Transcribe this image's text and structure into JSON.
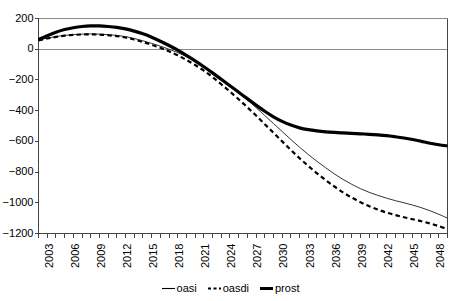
{
  "chart_data": {
    "type": "line",
    "title": "",
    "xlabel": "",
    "ylabel": "",
    "xlim": [
      2003,
      2050
    ],
    "ylim": [
      -1200,
      200
    ],
    "grid": false,
    "legend_position": "bottom-center",
    "y_ticks": [
      200,
      0,
      -200,
      -400,
      -600,
      -800,
      -1000,
      -1200
    ],
    "y_tick_labels": [
      "200",
      "0",
      "−200",
      "−400",
      "−600",
      "−800",
      "−1000",
      "−1200"
    ],
    "x_ticks": [
      2003,
      2006,
      2009,
      2012,
      2015,
      2018,
      2021,
      2024,
      2027,
      2030,
      2033,
      2036,
      2039,
      2042,
      2045,
      2048
    ],
    "x_tick_labels": [
      "2003",
      "2006",
      "2009",
      "2012",
      "2015",
      "2018",
      "2021",
      "2024",
      "2027",
      "2030",
      "2033",
      "2036",
      "2039",
      "2042",
      "2045",
      "2048"
    ],
    "x_minor_tick_step": 1,
    "x": [
      2003,
      2004,
      2005,
      2006,
      2007,
      2008,
      2009,
      2010,
      2011,
      2012,
      2013,
      2014,
      2015,
      2016,
      2017,
      2018,
      2019,
      2020,
      2021,
      2022,
      2023,
      2024,
      2025,
      2026,
      2027,
      2028,
      2029,
      2030,
      2031,
      2032,
      2033,
      2034,
      2035,
      2036,
      2037,
      2038,
      2039,
      2040,
      2041,
      2042,
      2043,
      2044,
      2045,
      2046,
      2047,
      2048,
      2049,
      2050
    ],
    "series": [
      {
        "name": "oasi",
        "style": "solid-thin",
        "color": "#333333",
        "values": [
          60,
          72,
          82,
          90,
          95,
          98,
          100,
          98,
          95,
          90,
          82,
          70,
          55,
          38,
          20,
          0,
          -22,
          -48,
          -78,
          -112,
          -150,
          -192,
          -236,
          -282,
          -330,
          -380,
          -432,
          -484,
          -536,
          -588,
          -638,
          -686,
          -730,
          -772,
          -812,
          -848,
          -880,
          -908,
          -932,
          -952,
          -970,
          -986,
          -1000,
          -1015,
          -1032,
          -1052,
          -1075,
          -1100
        ]
      },
      {
        "name": "oasdi",
        "style": "dashed",
        "color": "#000000",
        "values": [
          58,
          70,
          80,
          88,
          93,
          96,
          97,
          95,
          91,
          85,
          76,
          63,
          47,
          29,
          9,
          -14,
          -40,
          -70,
          -103,
          -140,
          -182,
          -228,
          -276,
          -326,
          -378,
          -432,
          -488,
          -544,
          -600,
          -656,
          -710,
          -760,
          -808,
          -852,
          -894,
          -932,
          -966,
          -996,
          -1022,
          -1044,
          -1064,
          -1080,
          -1094,
          -1107,
          -1120,
          -1135,
          -1152,
          -1172
        ]
      },
      {
        "name": "prost",
        "style": "solid-thick",
        "color": "#000000",
        "values": [
          62,
          88,
          110,
          128,
          140,
          148,
          152,
          152,
          148,
          142,
          132,
          118,
          100,
          78,
          52,
          24,
          -6,
          -40,
          -76,
          -114,
          -154,
          -196,
          -238,
          -280,
          -322,
          -364,
          -404,
          -440,
          -470,
          -494,
          -512,
          -524,
          -532,
          -538,
          -542,
          -545,
          -548,
          -551,
          -554,
          -558,
          -563,
          -570,
          -578,
          -588,
          -600,
          -612,
          -622,
          -630
        ]
      }
    ]
  },
  "legend": {
    "items": [
      {
        "label": "oasi",
        "style": "solid-thin"
      },
      {
        "label": "oasdi",
        "style": "dashed"
      },
      {
        "label": "prost",
        "style": "solid-thick"
      }
    ]
  }
}
